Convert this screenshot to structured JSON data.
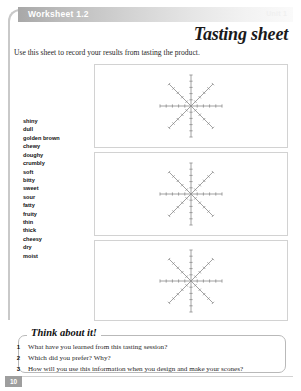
{
  "header": {
    "worksheet_label": "Worksheet 1.2",
    "unit_label": "Unit 1"
  },
  "title": "Tasting sheet",
  "instruction": "Use this sheet to record your results from tasting the product.",
  "descriptors": [
    "shiny",
    "dull",
    "golden brown",
    "chewy",
    "doughy",
    "crumbly",
    "soft",
    "bitty",
    "sweet",
    "sour",
    "fatty",
    "fruity",
    "thin",
    "thick",
    "cheesy",
    "dry",
    "moist"
  ],
  "charts": [
    {
      "id": "star-chart-1",
      "spokes": 8,
      "ticks_per_spoke": 5
    },
    {
      "id": "star-chart-2",
      "spokes": 8,
      "ticks_per_spoke": 5
    },
    {
      "id": "star-chart-3",
      "spokes": 8,
      "ticks_per_spoke": 5
    }
  ],
  "think_about_it": {
    "heading": "Think about it!",
    "questions": [
      {
        "number": "1",
        "text": "What have you learned from this tasting session?"
      },
      {
        "number": "2",
        "text": "Which did you prefer? Why?"
      },
      {
        "number": "3",
        "text": "How will you use this information when you design and make your scones?"
      }
    ]
  },
  "footer": {
    "page_number": "10"
  },
  "colors": {
    "header_bar_start": "#a8a8a8",
    "header_bar_end": "#fafafa",
    "frame_rule": "#c9c9c9",
    "box_border": "#d2d2d2",
    "star_line": "#8a8a8a",
    "text": "#1a1a1a",
    "page_number_bg": "#9e9e9e"
  }
}
